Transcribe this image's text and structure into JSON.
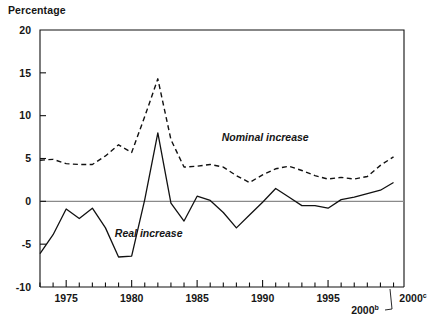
{
  "chart_data": {
    "type": "line",
    "title": "",
    "ylabel": "Percentage",
    "xlabel": "",
    "ylim": [
      -10,
      20
    ],
    "xlim": [
      1973,
      2000.8
    ],
    "grid": false,
    "legend_position": "inline-annotations",
    "y_ticks": [
      "20",
      "15",
      "10",
      "5",
      "0",
      "-5",
      "-10"
    ],
    "y_tick_values": [
      20,
      15,
      10,
      5,
      0,
      -5,
      -10
    ],
    "x_ticks": [
      "1975",
      "1980",
      "1985",
      "1990",
      "1995",
      "2000b",
      "2000c"
    ],
    "x_tick_values": [
      1975,
      1980,
      1985,
      1990,
      1995,
      1999.8,
      2000.6
    ],
    "x_tick_labels_plain": [
      "1975",
      "1980",
      "1985",
      "1990",
      "1995",
      "2000",
      "2000"
    ],
    "x_tick_label_sups": [
      "",
      "",
      "",
      "",
      "",
      "b",
      "c"
    ],
    "x_minor_tick_years": [
      1973,
      1974,
      1975,
      1976,
      1977,
      1978,
      1979,
      1980,
      1981,
      1982,
      1983,
      1984,
      1985,
      1986,
      1987,
      1988,
      1989,
      1990,
      1991,
      1992,
      1993,
      1994,
      1995,
      1996,
      1997,
      1998,
      1999,
      2000
    ],
    "zero_reference_line": 0,
    "series": [
      {
        "name": "Nominal increase",
        "style": "dashed",
        "color": "#111111",
        "x": [
          1973,
          1974,
          1975,
          1976,
          1977,
          1978,
          1979,
          1980,
          1981,
          1982,
          1983,
          1984,
          1985,
          1986,
          1987,
          1988,
          1989,
          1990,
          1991,
          1992,
          1993,
          1994,
          1995,
          1996,
          1997,
          1998,
          1999,
          2000
        ],
        "values": [
          4.8,
          4.9,
          4.4,
          4.3,
          4.3,
          5.3,
          6.6,
          5.7,
          9.9,
          14.3,
          7.2,
          4.0,
          4.1,
          4.3,
          4.0,
          3.0,
          2.2,
          3.1,
          3.8,
          4.1,
          3.6,
          3.0,
          2.6,
          2.8,
          2.6,
          2.9,
          4.2,
          5.2
        ]
      },
      {
        "name": "Real increase",
        "style": "solid",
        "color": "#111111",
        "x": [
          1973,
          1974,
          1975,
          1976,
          1977,
          1978,
          1979,
          1980,
          1981,
          1982,
          1983,
          1984,
          1985,
          1986,
          1987,
          1988,
          1989,
          1990,
          1991,
          1992,
          1993,
          1994,
          1995,
          1996,
          1997,
          1998,
          1999,
          2000
        ],
        "values": [
          -6.1,
          -3.9,
          -0.9,
          -2.0,
          -0.8,
          -3.1,
          -6.5,
          -6.4,
          0.2,
          8.0,
          -0.2,
          -2.3,
          0.6,
          0.1,
          -1.3,
          -3.1,
          -1.6,
          -0.1,
          1.5,
          0.5,
          -0.5,
          -0.5,
          -0.8,
          0.2,
          0.5,
          0.9,
          1.3,
          2.2
        ]
      }
    ],
    "annotations": [
      {
        "text": "Nominal increase",
        "x": 1990.2,
        "y": 7.0,
        "style": "italic"
      },
      {
        "text": "Real increase",
        "x": 1981.3,
        "y": -4.2,
        "style": "italic"
      }
    ]
  }
}
